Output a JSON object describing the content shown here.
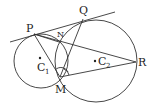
{
  "diagram": {
    "type": "geometry",
    "points": {
      "P": {
        "label": "P",
        "x": 34,
        "y": 34
      },
      "Q": {
        "label": "Q",
        "x": 83,
        "y": 19
      },
      "N": {
        "label": "N",
        "x": 59,
        "y": 40
      },
      "M": {
        "label": "M",
        "x": 60,
        "y": 77
      },
      "R": {
        "label": "R",
        "x": 136,
        "y": 62
      },
      "C1": {
        "label": "C",
        "sub": "1",
        "x": 41,
        "y": 59
      },
      "C2": {
        "label": "C",
        "sub": "2",
        "x": 95,
        "y": 61
      }
    },
    "circles": [
      {
        "name": "C1",
        "cx": 41,
        "cy": 61,
        "r": 27
      },
      {
        "name": "C2",
        "cx": 96,
        "cy": 61,
        "r": 41
      }
    ],
    "colors": {
      "stroke": "#333333",
      "text": "#222222",
      "background": "#ffffff"
    }
  }
}
